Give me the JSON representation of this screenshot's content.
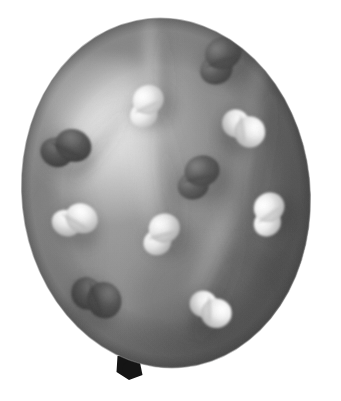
{
  "image": {
    "kind": "natural-photograph",
    "subject": "polka-dot balloon",
    "alt_text": "A grayscale photograph of an inflated round balloon covered with light and dark polka dots, tied with a knot at the bottom, on a plain white background.",
    "width": 341,
    "height": 401,
    "background_color": "#ffffff",
    "color_mode": "grayscale"
  },
  "balloon": {
    "name": "balloon-body",
    "center_x": 166,
    "center_y": 193,
    "radius_x": 144,
    "radius_y": 175,
    "rotation_deg": -6,
    "base_color": "#9a9a9a",
    "highlight_color": "#d2d2d2",
    "midtone_color": "#9b9b9b",
    "shadow_color": "#5f6060",
    "edge_color": "#6a6a6a",
    "highlight_center_x": 118,
    "highlight_center_y": 135,
    "knot": {
      "name": "balloon-knot",
      "x": 129,
      "y": 366,
      "width": 17,
      "height": 16,
      "color": "#151515"
    },
    "creases": [
      {
        "name": "crease-top-center",
        "x": 152,
        "y": 70,
        "w": 10,
        "h": 62,
        "angle": -3,
        "tone": "#b7b7b7"
      },
      {
        "name": "crease-upper-left",
        "x": 92,
        "y": 130,
        "w": 13,
        "h": 58,
        "angle": 38,
        "tone": "#b9b9b9"
      },
      {
        "name": "crease-center",
        "x": 146,
        "y": 175,
        "w": 18,
        "h": 86,
        "angle": -8,
        "tone": "#aeaeae"
      },
      {
        "name": "crease-lower-right",
        "x": 206,
        "y": 268,
        "w": 16,
        "h": 74,
        "angle": 22,
        "tone": "#8b8b8b"
      },
      {
        "name": "crease-right",
        "x": 245,
        "y": 150,
        "w": 14,
        "h": 92,
        "angle": 10,
        "tone": "#7c7c7c"
      }
    ]
  },
  "dots": [
    {
      "name": "dot-dark-top-right",
      "tone": "dark",
      "cx": 220,
      "cy": 60,
      "rx": 20,
      "ry": 18,
      "angle": -20,
      "fill": "#5a5a5a",
      "shade": "#3f3f3f",
      "spec": "#7c7c7c"
    },
    {
      "name": "dot-dark-left",
      "tone": "dark",
      "cx": 66,
      "cy": 148,
      "rx": 20,
      "ry": 18,
      "angle": 25,
      "fill": "#565656",
      "shade": "#3b3b3b",
      "spec": "#767676"
    },
    {
      "name": "dot-dark-center",
      "tone": "dark",
      "cx": 198,
      "cy": 177,
      "rx": 19,
      "ry": 17,
      "angle": -12,
      "fill": "#5e5e5e",
      "shade": "#434343",
      "spec": "#808080"
    },
    {
      "name": "dot-dark-bottom-left",
      "tone": "dark",
      "cx": 97,
      "cy": 297,
      "rx": 20,
      "ry": 19,
      "angle": 70,
      "fill": "#545454",
      "shade": "#3a3a3a",
      "spec": "#737373"
    },
    {
      "name": "dot-light-top-center",
      "tone": "light",
      "cx": 146,
      "cy": 106,
      "rx": 17,
      "ry": 16,
      "angle": -25,
      "fill": "#ececec",
      "shade": "#b4b4b4",
      "spec": "#ffffff"
    },
    {
      "name": "dot-light-upper-right",
      "tone": "light",
      "cx": 244,
      "cy": 128,
      "rx": 17,
      "ry": 17,
      "angle": 82,
      "fill": "#e9e9e9",
      "shade": "#b0b0b0",
      "spec": "#fdfdfd"
    },
    {
      "name": "dot-light-mid-right",
      "tone": "light",
      "cx": 268,
      "cy": 214,
      "rx": 17,
      "ry": 16,
      "angle": -35,
      "fill": "#ededed",
      "shade": "#b2b2b2",
      "spec": "#ffffff"
    },
    {
      "name": "dot-light-mid-left",
      "tone": "light",
      "cx": 75,
      "cy": 220,
      "rx": 18,
      "ry": 16,
      "angle": 30,
      "fill": "#e8e8e8",
      "shade": "#ababab",
      "spec": "#ffffff"
    },
    {
      "name": "dot-light-center",
      "tone": "light",
      "cx": 161,
      "cy": 234,
      "rx": 17,
      "ry": 16,
      "angle": -15,
      "fill": "#e6e6e6",
      "shade": "#aaaaaa",
      "spec": "#fbfbfb"
    },
    {
      "name": "dot-light-bottom-right",
      "tone": "light",
      "cx": 211,
      "cy": 309,
      "rx": 16,
      "ry": 17,
      "angle": 88,
      "fill": "#ededed",
      "shade": "#b0b0b0",
      "spec": "#ffffff"
    }
  ],
  "counts": {
    "total_dots": 10,
    "dark_dots": 4,
    "light_dots": 6
  }
}
